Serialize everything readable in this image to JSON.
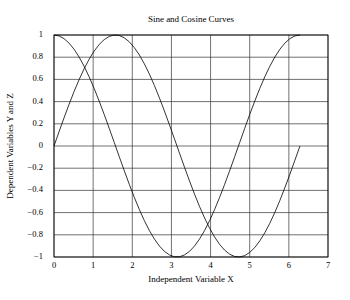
{
  "chart_data": {
    "type": "line",
    "title": "Sine and Cosine Curves",
    "xlabel": "Independent Variable X",
    "ylabel": "Dependent Variables Y and Z",
    "xlim": [
      0,
      7
    ],
    "ylim": [
      -1,
      1
    ],
    "grid": true,
    "legend": null,
    "x_ticks": [
      "0",
      "1",
      "2",
      "3",
      "4",
      "5",
      "6",
      "7"
    ],
    "y_ticks": [
      "1",
      "0.8",
      "0.6",
      "0.4",
      "0.2",
      "0",
      "−0.2",
      "−0.4",
      "−0.6",
      "−0.8",
      "−1"
    ],
    "x_range_of_data": [
      0,
      6.2832
    ],
    "num_points": 50,
    "series": [
      {
        "name": "Y = sin(X)",
        "function": "sin",
        "color": "#000000"
      },
      {
        "name": "Z = cos(X)",
        "function": "cos",
        "color": "#000000"
      }
    ],
    "sample_points": {
      "x": [
        0,
        0.5,
        1.0,
        1.5708,
        2.0,
        2.5,
        3.1416,
        3.5,
        4.0,
        4.7124,
        5.0,
        5.5,
        6.2832
      ],
      "sin": [
        0,
        0.479,
        0.841,
        1.0,
        0.909,
        0.598,
        0,
        -0.351,
        -0.757,
        -1.0,
        -0.959,
        -0.706,
        0
      ],
      "cos": [
        1.0,
        0.878,
        0.54,
        0,
        -0.416,
        -0.801,
        -1.0,
        -0.936,
        -0.654,
        0,
        0.284,
        0.709,
        1.0
      ]
    }
  },
  "colors": {
    "background": "#ffffff",
    "axes": "#000000",
    "grid": "#333333",
    "line": "#000000"
  }
}
